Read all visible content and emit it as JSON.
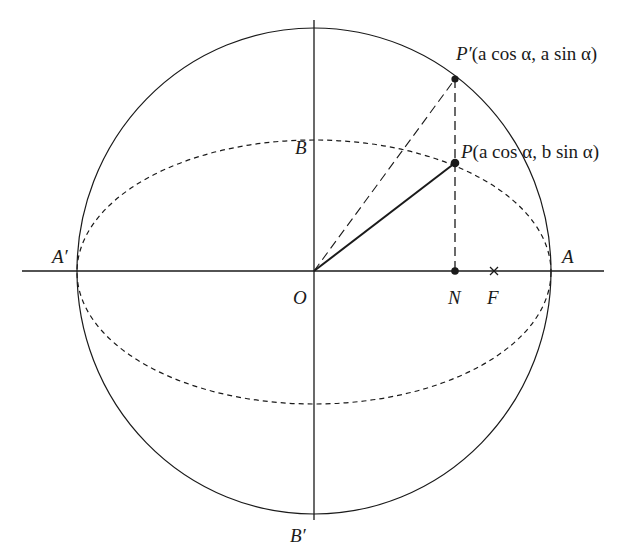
{
  "figure": {
    "colors": {
      "ink": "#1a1a1a",
      "background": "#ffffff"
    }
  },
  "labels": {
    "origin": "O",
    "right_vertex": "A",
    "left_vertex": "A′",
    "top_minor": "B",
    "bottom_minor": "B′",
    "foot": "N",
    "focus": "F",
    "p_prime_name": "P′",
    "p_prime_coords": "(a cos α, a sin α)",
    "p_name": "P",
    "p_coords": "(a cos α, b sin α)"
  },
  "geometry": {
    "center": [
      314,
      271
    ],
    "auxiliary_circle": {
      "rx": 237,
      "ry": 243,
      "style": "solid"
    },
    "ellipse": {
      "rx": 237,
      "ry": 132,
      "style": "dashed"
    },
    "x_axis": {
      "from": 22,
      "to": 604
    },
    "y_axis": {
      "from": 20,
      "to": 520
    },
    "points": {
      "P_prime": [
        455,
        79
      ],
      "P": [
        455,
        163
      ],
      "N": [
        455,
        271
      ],
      "F": [
        494,
        271
      ]
    }
  }
}
